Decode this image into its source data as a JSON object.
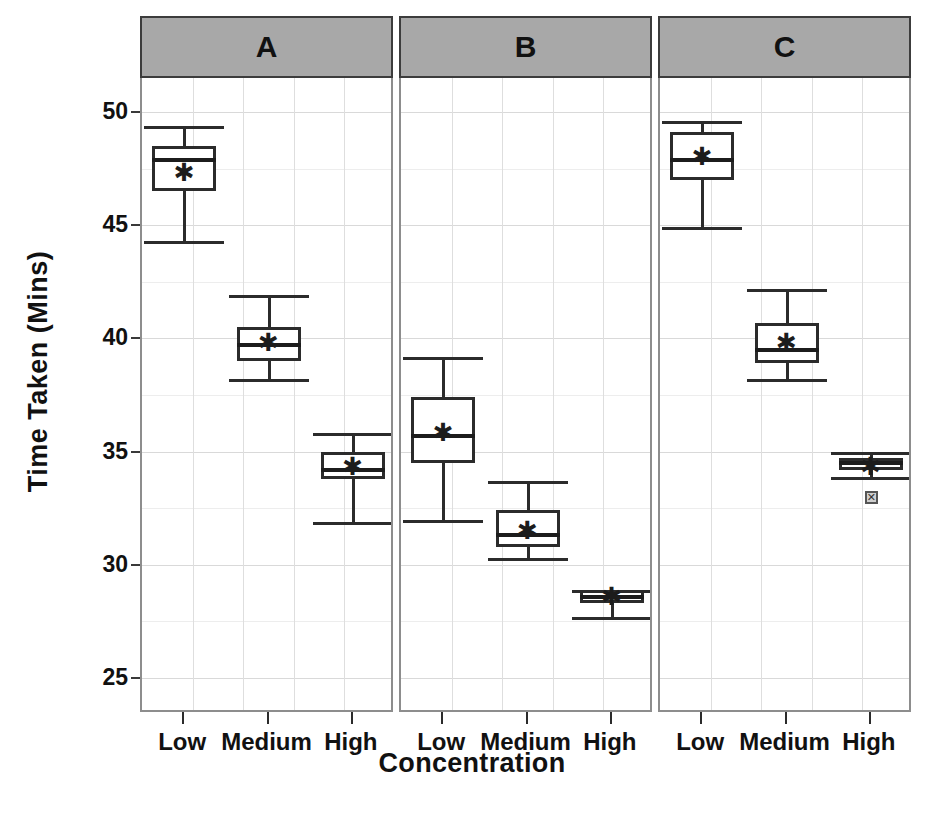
{
  "chart_data": {
    "type": "box",
    "title": "",
    "xlabel": "Concentration",
    "ylabel": "Time Taken (Mins)",
    "ylim": [
      23.5,
      51.5
    ],
    "yticks": [
      50,
      45,
      40,
      35,
      30,
      25
    ],
    "ytick_labels": [
      "50",
      "45",
      "40",
      "35",
      "30",
      "25"
    ],
    "grid": true,
    "legend": "none",
    "panel_label_title": "",
    "categories": [
      "Low",
      "Medium",
      "High"
    ],
    "panels": [
      {
        "label": "A",
        "boxes": [
          {
            "category": "Low",
            "whisker_low": 44.3,
            "q1": 46.5,
            "median": 47.9,
            "q3": 48.5,
            "whisker_high": 49.4,
            "mean": 47.3,
            "outliers": []
          },
          {
            "category": "Medium",
            "whisker_low": 38.2,
            "q1": 39.0,
            "median": 39.7,
            "q3": 40.5,
            "whisker_high": 41.9,
            "mean": 39.8,
            "outliers": []
          },
          {
            "category": "High",
            "whisker_low": 31.9,
            "q1": 33.8,
            "median": 34.2,
            "q3": 35.0,
            "whisker_high": 35.8,
            "mean": 34.3,
            "outliers": []
          }
        ]
      },
      {
        "label": "B",
        "boxes": [
          {
            "category": "Low",
            "whisker_low": 32.0,
            "q1": 34.5,
            "median": 35.7,
            "q3": 37.4,
            "whisker_high": 39.2,
            "mean": 35.8,
            "outliers": []
          },
          {
            "category": "Medium",
            "whisker_low": 30.3,
            "q1": 30.8,
            "median": 31.3,
            "q3": 32.4,
            "whisker_high": 33.7,
            "mean": 31.5,
            "outliers": []
          },
          {
            "category": "High",
            "whisker_low": 27.7,
            "q1": 28.3,
            "median": 28.6,
            "q3": 28.9,
            "whisker_high": 28.9,
            "mean": 28.6,
            "outliers": []
          }
        ]
      },
      {
        "label": "C",
        "boxes": [
          {
            "category": "Low",
            "whisker_low": 44.9,
            "q1": 47.0,
            "median": 47.9,
            "q3": 49.1,
            "whisker_high": 49.6,
            "mean": 48.0,
            "outliers": []
          },
          {
            "category": "Medium",
            "whisker_low": 38.2,
            "q1": 38.9,
            "median": 39.5,
            "q3": 40.7,
            "whisker_high": 42.2,
            "mean": 39.8,
            "outliers": []
          },
          {
            "category": "High",
            "whisker_low": 33.9,
            "q1": 34.2,
            "median": 34.5,
            "q3": 34.7,
            "whisker_high": 35.0,
            "mean": 34.3,
            "outliers": [
              33.0
            ]
          }
        ]
      }
    ],
    "mean_marker": "asterisk",
    "outlier_marker": "crossed-square"
  },
  "axis": {
    "ylabel": "Time Taken (Mins)",
    "xlabel": "Concentration"
  },
  "panel_labels": [
    "A",
    "B",
    "C"
  ],
  "xtick_labels": [
    "Low",
    "Medium",
    "High"
  ],
  "ytick_labels": [
    "50",
    "45",
    "40",
    "35",
    "30",
    "25"
  ],
  "colors": {
    "panel_header_bg": "#a8a8a8",
    "panel_border": "#8d8d8d",
    "grid": "#d9d9d9",
    "box_stroke": "#2b2b2b",
    "box_fill": "#ffffff",
    "text": "#111111"
  },
  "caption": ""
}
